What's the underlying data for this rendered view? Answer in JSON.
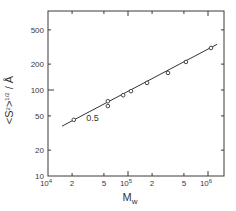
{
  "chart_data": {
    "type": "scatter",
    "title": "",
    "xlabel": "M_w",
    "ylabel": "<S²>^1/2 / Å",
    "xscale": "log",
    "yscale": "log",
    "xlim": [
      10000,
      1600000
    ],
    "ylim": [
      10,
      830
    ],
    "grid": false,
    "legend": null,
    "x_ticks": [
      {
        "value": 10000,
        "label": "10⁴"
      },
      {
        "value": 20000,
        "label": "2"
      },
      {
        "value": 50000,
        "label": "5"
      },
      {
        "value": 100000,
        "label": "10⁵"
      },
      {
        "value": 200000,
        "label": "2"
      },
      {
        "value": 500000,
        "label": "5"
      },
      {
        "value": 1000000,
        "label": "10⁶"
      }
    ],
    "y_ticks": [
      {
        "value": 10,
        "label": "10"
      },
      {
        "value": 20,
        "label": "20"
      },
      {
        "value": 50,
        "label": "50"
      },
      {
        "value": 100,
        "label": "100"
      },
      {
        "value": 200,
        "label": "200"
      },
      {
        "value": 500,
        "label": "500"
      }
    ],
    "series": [
      {
        "name": "data",
        "marker": "open-circle",
        "points": [
          {
            "x": 21000,
            "y": 45
          },
          {
            "x": 56000,
            "y": 74
          },
          {
            "x": 56000,
            "y": 65
          },
          {
            "x": 87000,
            "y": 87
          },
          {
            "x": 109000,
            "y": 97
          },
          {
            "x": 173000,
            "y": 121
          },
          {
            "x": 316000,
            "y": 158
          },
          {
            "x": 530000,
            "y": 212
          },
          {
            "x": 1090000,
            "y": 308
          }
        ]
      },
      {
        "name": "fit",
        "type": "line",
        "slope": 0.5,
        "points": [
          {
            "x": 15000,
            "y": 38
          },
          {
            "x": 1300000,
            "y": 340
          }
        ]
      }
    ],
    "annotations": [
      {
        "text": "0.5",
        "x": 30000,
        "y": 44
      }
    ]
  }
}
